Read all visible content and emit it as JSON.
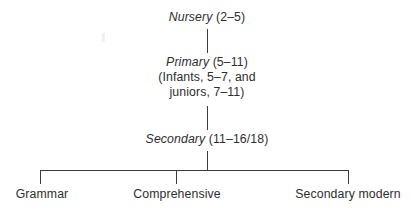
{
  "diagram": {
    "type": "tree",
    "stroke_color": "#3b3b3b",
    "background_color": "#ffffff",
    "text_color": "#2e2e2e",
    "nodes": [
      {
        "id": "nursery",
        "stage": "Nursery",
        "ages": "(2–5)",
        "lines": [
          "Nursery (2–5)"
        ]
      },
      {
        "id": "primary",
        "stage": "Primary",
        "ages": "(5–11)",
        "lines": [
          "Primary (5–11)",
          "(Infants, 5–7, and",
          "juniors, 7–11)"
        ],
        "detail_line_1": "(Infants, 5–7, and",
        "detail_line_2": "juniors, 7–11)"
      },
      {
        "id": "secondary",
        "stage": "Secondary",
        "ages": "(11–16/18)",
        "lines": [
          "Secondary (11–16/18)"
        ]
      }
    ],
    "branches": [
      {
        "id": "grammar",
        "label": "Grammar"
      },
      {
        "id": "comprehensive",
        "label": "Comprehensive"
      },
      {
        "id": "secondary-modern",
        "label": "Secondary modern"
      }
    ]
  }
}
